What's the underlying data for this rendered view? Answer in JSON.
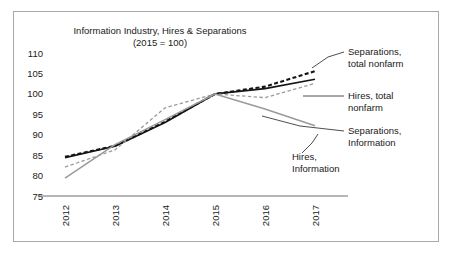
{
  "chart_data": {
    "type": "line",
    "title": "Information Industry, Hires & Separations",
    "subtitle": "(2015 = 100)",
    "xlabel": "",
    "ylabel": "",
    "categories": [
      "2012",
      "2013",
      "2014",
      "2015",
      "2016",
      "2017"
    ],
    "x": [
      2012,
      2013,
      2014,
      2015,
      2016,
      2017
    ],
    "ylim": [
      75,
      112
    ],
    "xlim": [
      2011.7,
      2017.6
    ],
    "yticks": [
      110,
      105,
      100,
      95,
      90,
      85,
      80,
      75
    ],
    "ytick_labels": [
      "110",
      "105",
      "100",
      "95",
      "90",
      "85",
      "80",
      "75"
    ],
    "grid": false,
    "legend_position": "right-annotations",
    "series": [
      {
        "name": "Separations, total nonfarm",
        "style": "dashed",
        "color": "#141414",
        "width": 2.1,
        "values": [
          84.6,
          87.3,
          93.2,
          100.0,
          101.8,
          105.6
        ]
      },
      {
        "name": "Hires, total nonfarm",
        "style": "solid",
        "color": "#141414",
        "width": 1.7,
        "values": [
          84.4,
          87.2,
          93.0,
          100.0,
          101.3,
          103.6
        ]
      },
      {
        "name": "Separations, Information",
        "style": "dashed",
        "color": "#9a9a9a",
        "width": 1.3,
        "values": [
          82.1,
          86.3,
          96.6,
          100.0,
          99.1,
          102.6
        ]
      },
      {
        "name": "Hires, Information",
        "style": "solid",
        "color": "#9a9a9a",
        "width": 1.5,
        "values": [
          79.4,
          87.6,
          93.7,
          100.0,
          96.3,
          92.2
        ]
      }
    ],
    "annotations": [
      {
        "id": "separations-total-nonfarm",
        "lines": [
          "Separations,",
          "total nonfarm"
        ],
        "text_x": 348,
        "text_y": 55,
        "leader": [
          [
            344,
            52
          ],
          [
            328,
            57
          ],
          [
            312,
            68
          ]
        ]
      },
      {
        "id": "hires-total-nonfarm",
        "lines": [
          "Hires, total",
          "nonfarm"
        ],
        "text_x": 348,
        "text_y": 99,
        "leader": [
          [
            344,
            96
          ],
          [
            322,
            96
          ],
          [
            303,
            96
          ]
        ]
      },
      {
        "id": "separations-information",
        "lines": [
          "Separations,",
          "Information"
        ],
        "text_x": 348,
        "text_y": 134,
        "leader": [
          [
            344,
            131
          ],
          [
            300,
            126
          ],
          [
            262,
            116
          ]
        ]
      },
      {
        "id": "hires-information",
        "lines": [
          "Hires,",
          "Information"
        ],
        "text_x": 292,
        "text_y": 160,
        "leader": [
          [
            302,
            153
          ],
          [
            312,
            143
          ],
          [
            318,
            134
          ]
        ]
      }
    ]
  },
  "axes": {
    "plot_left": 50,
    "plot_right": 345,
    "plot_top": 45,
    "plot_bottom": 196
  },
  "labels": {
    "title_x": 160,
    "title_y": 34,
    "subtitle_y": 46
  }
}
